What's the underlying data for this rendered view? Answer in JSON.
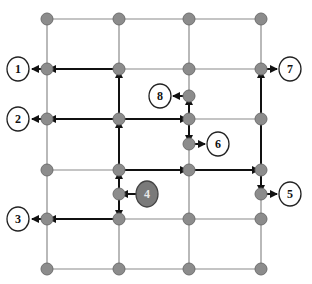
{
  "diagram": {
    "type": "grid-network-routing",
    "grid": {
      "columns_x": [
        47,
        119,
        189,
        261
      ],
      "rows_y": [
        19,
        69,
        119,
        170,
        219,
        269
      ]
    },
    "extra_nodes": [
      {
        "id": "n4-target",
        "x": 119,
        "y": 194
      },
      {
        "id": "n8-source",
        "x": 189,
        "y": 96
      },
      {
        "id": "n6-source",
        "x": 189,
        "y": 144
      },
      {
        "id": "n5-source",
        "x": 261,
        "y": 194
      }
    ],
    "labels": [
      {
        "id": "1",
        "text": "1",
        "x": 18,
        "y": 69,
        "style": "outline"
      },
      {
        "id": "2",
        "text": "2",
        "x": 18,
        "y": 119,
        "style": "outline"
      },
      {
        "id": "3",
        "text": "3",
        "x": 18,
        "y": 219,
        "style": "outline"
      },
      {
        "id": "4",
        "text": "4",
        "x": 147,
        "y": 194,
        "style": "filled"
      },
      {
        "id": "5",
        "text": "5",
        "x": 290,
        "y": 194,
        "style": "outline"
      },
      {
        "id": "6",
        "text": "6",
        "x": 218,
        "y": 144,
        "style": "outline"
      },
      {
        "id": "7",
        "text": "7",
        "x": 290,
        "y": 69,
        "style": "outline"
      },
      {
        "id": "8",
        "text": "8",
        "x": 160,
        "y": 96,
        "style": "outline"
      }
    ],
    "colors": {
      "grid": "#8a8a8a",
      "node": "#8c8c8c",
      "path": "#111111",
      "filled_label": "#7a7a7a"
    }
  }
}
